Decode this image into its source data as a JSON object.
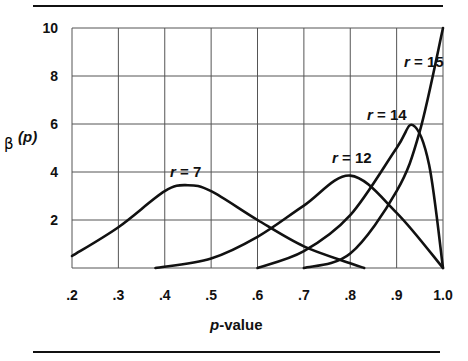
{
  "chart_data": {
    "type": "line",
    "title": "",
    "xlabel": "p-value",
    "ylabel": "β(p)",
    "xlim": [
      0.2,
      1.0
    ],
    "ylim": [
      0,
      10
    ],
    "grid": true,
    "x_ticks": [
      ".2",
      ".3",
      ".4",
      ".5",
      ".6",
      ".7",
      ".8",
      ".9",
      "1.0"
    ],
    "y_ticks": [
      "2",
      "4",
      "6",
      "8",
      "10"
    ],
    "series": [
      {
        "name": "r = 7",
        "x": [
          0.2,
          0.3,
          0.4,
          0.45,
          0.5,
          0.6,
          0.7,
          0.8,
          0.83
        ],
        "y": [
          0.5,
          1.7,
          3.2,
          3.45,
          3.2,
          2.0,
          0.9,
          0.2,
          0.0
        ]
      },
      {
        "name": "r = 12",
        "x": [
          0.38,
          0.5,
          0.6,
          0.7,
          0.8,
          0.9,
          1.0
        ],
        "y": [
          0.0,
          0.4,
          1.3,
          2.6,
          3.85,
          2.3,
          0.0
        ]
      },
      {
        "name": "r = 14",
        "x": [
          0.6,
          0.7,
          0.8,
          0.9,
          0.935,
          0.97,
          1.0
        ],
        "y": [
          0.0,
          0.7,
          2.2,
          5.0,
          5.95,
          4.3,
          0.0
        ]
      },
      {
        "name": "r = 15",
        "x": [
          0.7,
          0.8,
          0.9,
          0.95,
          1.0
        ],
        "y": [
          0.0,
          0.6,
          3.2,
          5.7,
          10.0
        ]
      }
    ],
    "annotations": [
      "r = 7",
      "r = 12",
      "r = 14",
      "r = 15"
    ]
  },
  "labels": {
    "xlabel_italic": "p",
    "xlabel_rest": "-value",
    "ylabel_beta": "β",
    "ylabel_p": "(p)",
    "r7": "r = 7",
    "r12": "r = 12",
    "r14": "r = 14",
    "r15": "r = 15"
  }
}
